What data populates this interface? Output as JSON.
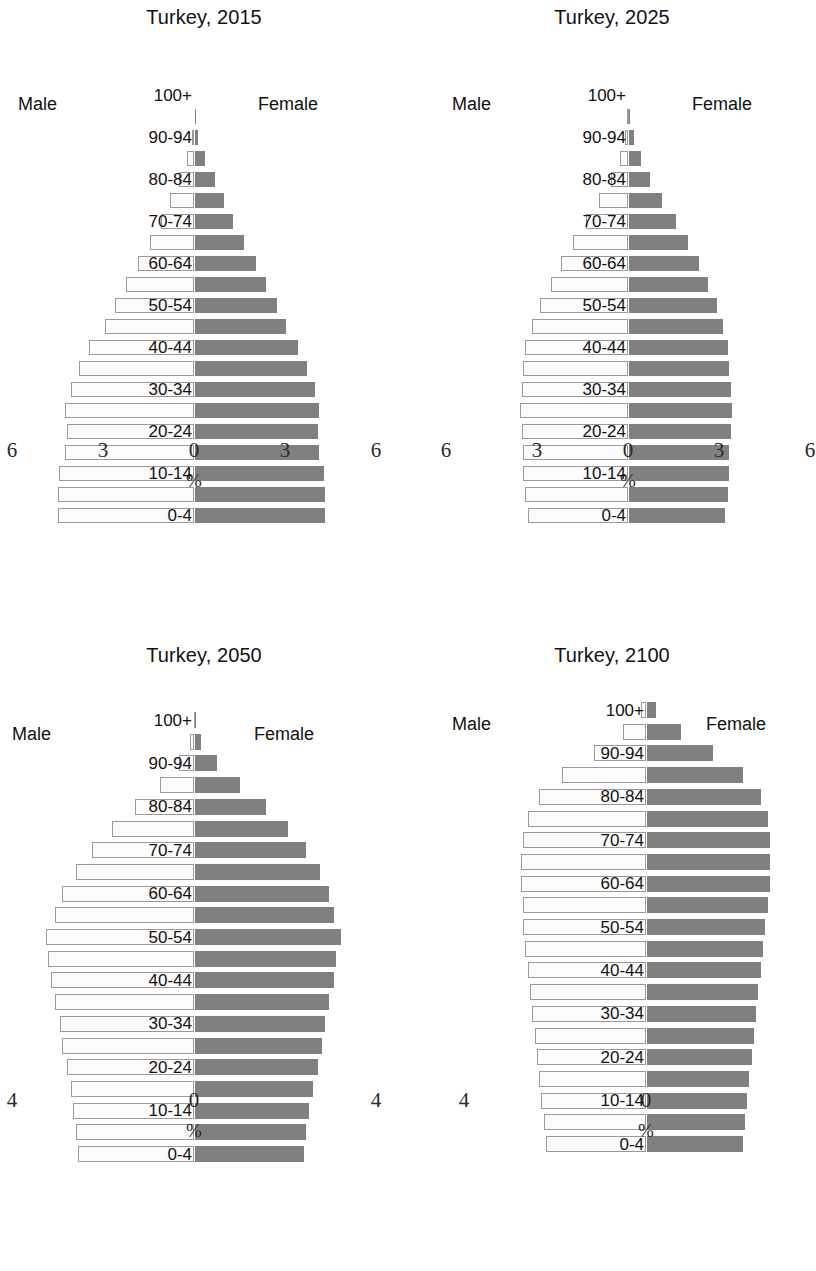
{
  "figure": {
    "region": "Turkey",
    "male_label": "Male",
    "female_label": "Female",
    "axis_unit": "%",
    "male_color": "#fbfbfb",
    "female_color": "#808080",
    "male_border_color": "#9a9a9a"
  },
  "age_groups": [
    "0-4",
    "5-9",
    "10-14",
    "15-19",
    "20-24",
    "25-29",
    "30-34",
    "35-39",
    "40-44",
    "45-49",
    "50-54",
    "55-59",
    "60-64",
    "65-69",
    "70-74",
    "75-79",
    "80-84",
    "85-89",
    "90-94",
    "95-99",
    "100+"
  ],
  "visible_age_labels": [
    "0-4",
    "10-14",
    "20-24",
    "30-34",
    "40-44",
    "50-54",
    "60-64",
    "70-74",
    "80-84",
    "90-94",
    "100+"
  ],
  "chart_data": [
    {
      "type": "bar",
      "subtype": "population-pyramid",
      "title": "Turkey, 2015",
      "xlabel": "%",
      "ylabel": "",
      "xlim": [
        -6,
        6
      ],
      "xticks": [
        -6,
        -3,
        0,
        3,
        6
      ],
      "xticklabels": [
        "6",
        "3",
        "0",
        "3",
        "6"
      ],
      "grid": false,
      "categories": [
        "0-4",
        "5-9",
        "10-14",
        "15-19",
        "20-24",
        "25-29",
        "30-34",
        "35-39",
        "40-44",
        "45-49",
        "50-54",
        "55-59",
        "60-64",
        "65-69",
        "70-74",
        "75-79",
        "80-84",
        "85-89",
        "90-94",
        "95-99",
        "100+"
      ],
      "series": [
        {
          "name": "Male",
          "values": [
            4.5,
            4.5,
            4.45,
            4.25,
            4.2,
            4.25,
            4.05,
            3.8,
            3.45,
            2.95,
            2.6,
            2.25,
            1.85,
            1.45,
            1.1,
            0.8,
            0.5,
            0.22,
            0.07,
            0.01,
            0.0
          ]
        },
        {
          "name": "Female",
          "values": [
            4.3,
            4.3,
            4.25,
            4.1,
            4.05,
            4.1,
            3.95,
            3.7,
            3.4,
            3.0,
            2.7,
            2.35,
            2.0,
            1.6,
            1.25,
            0.95,
            0.65,
            0.32,
            0.11,
            0.02,
            0.0
          ]
        }
      ]
    },
    {
      "type": "bar",
      "subtype": "population-pyramid",
      "title": "Turkey, 2025",
      "xlabel": "%",
      "ylabel": "",
      "xlim": [
        -6,
        6
      ],
      "xticks": [
        -6,
        -3,
        0,
        3,
        6
      ],
      "xticklabels": [
        "6",
        "3",
        "0",
        "3",
        "6"
      ],
      "grid": false,
      "categories": [
        "0-4",
        "5-9",
        "10-14",
        "15-19",
        "20-24",
        "25-29",
        "30-34",
        "35-39",
        "40-44",
        "45-49",
        "50-54",
        "55-59",
        "60-64",
        "65-69",
        "70-74",
        "75-79",
        "80-84",
        "85-89",
        "90-94",
        "95-99",
        "100+"
      ],
      "series": [
        {
          "name": "Male",
          "values": [
            3.3,
            3.4,
            3.45,
            3.45,
            3.5,
            3.55,
            3.5,
            3.45,
            3.4,
            3.15,
            2.9,
            2.55,
            2.2,
            1.8,
            1.4,
            0.95,
            0.55,
            0.28,
            0.1,
            0.02,
            0.0
          ]
        },
        {
          "name": "Female",
          "values": [
            3.15,
            3.25,
            3.3,
            3.3,
            3.35,
            3.4,
            3.35,
            3.3,
            3.25,
            3.1,
            2.9,
            2.6,
            2.3,
            1.95,
            1.55,
            1.1,
            0.7,
            0.38,
            0.15,
            0.03,
            0.0
          ]
        }
      ]
    },
    {
      "type": "bar",
      "subtype": "population-pyramid",
      "title": "Turkey, 2050",
      "xlabel": "%",
      "ylabel": "",
      "xlim": [
        -4,
        4
      ],
      "xticks": [
        -4,
        0,
        4
      ],
      "xticklabels": [
        "4",
        "0",
        "4"
      ],
      "grid": false,
      "categories": [
        "0-4",
        "5-9",
        "10-14",
        "15-19",
        "20-24",
        "25-29",
        "30-34",
        "35-39",
        "40-44",
        "45-49",
        "50-54",
        "55-59",
        "60-64",
        "65-69",
        "70-74",
        "75-79",
        "80-84",
        "85-89",
        "90-94",
        "95-99",
        "100+"
      ],
      "series": [
        {
          "name": "Male",
          "values": [
            2.55,
            2.6,
            2.65,
            2.7,
            2.8,
            2.9,
            2.95,
            3.05,
            3.15,
            3.2,
            3.25,
            3.05,
            2.9,
            2.6,
            2.25,
            1.8,
            1.3,
            0.75,
            0.32,
            0.08,
            0.01
          ]
        },
        {
          "name": "Female",
          "values": [
            2.4,
            2.45,
            2.5,
            2.6,
            2.7,
            2.8,
            2.85,
            2.95,
            3.05,
            3.1,
            3.2,
            3.05,
            2.95,
            2.75,
            2.45,
            2.05,
            1.55,
            0.98,
            0.48,
            0.14,
            0.02
          ]
        }
      ]
    },
    {
      "type": "bar",
      "subtype": "population-pyramid",
      "title": "Turkey, 2100",
      "xlabel": "%",
      "ylabel": "",
      "xlim": [
        -4,
        4
      ],
      "xticks": [
        -4,
        0,
        4
      ],
      "xticklabels": [
        "4",
        "0",
        "4"
      ],
      "grid": false,
      "categories": [
        "0-4",
        "5-9",
        "10-14",
        "15-19",
        "20-24",
        "25-29",
        "30-34",
        "35-39",
        "40-44",
        "45-49",
        "50-54",
        "55-59",
        "60-64",
        "65-69",
        "70-74",
        "75-79",
        "80-84",
        "85-89",
        "90-94",
        "95-99",
        "100+"
      ],
      "series": [
        {
          "name": "Male",
          "values": [
            2.2,
            2.25,
            2.3,
            2.35,
            2.4,
            2.45,
            2.5,
            2.55,
            2.6,
            2.65,
            2.7,
            2.7,
            2.75,
            2.75,
            2.7,
            2.6,
            2.35,
            1.85,
            1.15,
            0.5,
            0.1
          ]
        },
        {
          "name": "Female",
          "values": [
            2.1,
            2.15,
            2.2,
            2.25,
            2.3,
            2.35,
            2.4,
            2.45,
            2.5,
            2.55,
            2.6,
            2.65,
            2.7,
            2.7,
            2.7,
            2.65,
            2.5,
            2.1,
            1.45,
            0.75,
            0.2
          ]
        }
      ]
    }
  ]
}
